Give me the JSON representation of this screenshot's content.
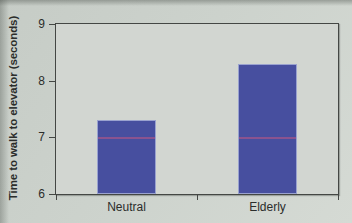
{
  "chart_data": {
    "type": "bar",
    "title": "",
    "xlabel": "",
    "ylabel": "Time to walk to elevator (seconds)",
    "categories": [
      "Neutral",
      "Elderly"
    ],
    "values": [
      7.3,
      8.3
    ],
    "ylim": [
      6,
      9
    ],
    "yticks": [
      6,
      7,
      8,
      9
    ],
    "grid": "off",
    "legend": "none",
    "artifact_line_y": 7,
    "colors": {
      "bar_fill": "#474f9f",
      "bar_border": "#9aa2cf",
      "axis": "#444744",
      "plot_background": "#d2d6d1",
      "page_background": "#ccd2cc",
      "tick_text": "#2b2d2b",
      "artifact_line": "rgba(193,88,130,0.55)"
    }
  }
}
